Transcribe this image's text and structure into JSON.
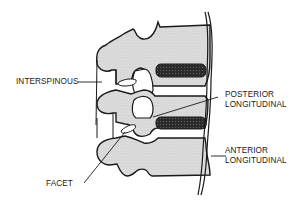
{
  "diagram": {
    "colors": {
      "bone_fill": "#d8d8d8",
      "outline": "#1a1a1a",
      "disc": "#3a3a3a",
      "background": "#ffffff"
    },
    "labels": {
      "interspinous": "INTERSPINOUS",
      "posterior_line1": "POSTERIOR",
      "posterior_line2": "LONGITUDINAL",
      "anterior_line1": "ANTERIOR",
      "anterior_line2": "LONGITUDINAL",
      "facet": "FACET"
    }
  }
}
